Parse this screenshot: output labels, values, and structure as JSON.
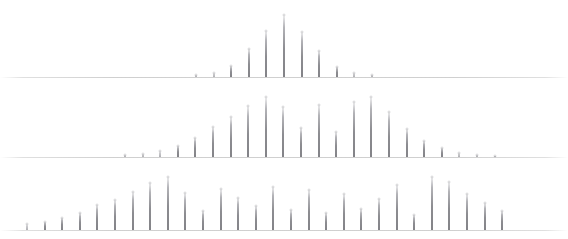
{
  "figure": {
    "title": "",
    "background_color": "#ffffff",
    "peak_color": "#78787d",
    "baseline_color": "#969696",
    "width": 568,
    "height": 239
  },
  "chart_data": {
    "type": "bar",
    "title": "",
    "subtitle": "",
    "xlabel": "",
    "ylabel": "",
    "grid": false,
    "legend_position": "none",
    "axis_ranges": {
      "x": [
        0,
        568
      ],
      "y": [
        0,
        1
      ]
    },
    "panels": [
      {
        "name": "panel-top",
        "index": 0,
        "baseline_y": 77,
        "max_peak_height": 62,
        "peak_spacing_px": 17.6,
        "first_peak_x": 196,
        "peak_count": 11,
        "x": [
          196,
          213.6,
          231.2,
          248.8,
          266.4,
          284,
          301.6,
          319.2,
          336.8,
          354.4,
          372
        ],
        "values": [
          0.035,
          0.07,
          0.17,
          0.45,
          0.74,
          1.0,
          0.73,
          0.42,
          0.16,
          0.07,
          0.03
        ],
        "tick_labels": [],
        "legend": []
      },
      {
        "name": "panel-middle",
        "index": 1,
        "baseline_y": 157,
        "max_peak_height": 62,
        "peak_spacing_px": 17.6,
        "first_peak_x": 125,
        "peak_count": 22,
        "x": [
          125,
          142.6,
          160.2,
          177.8,
          195.4,
          213,
          230.6,
          248.2,
          265.8,
          283.4,
          301,
          318.6,
          336.2,
          353.8,
          371.4,
          389,
          406.6,
          424.2,
          441.8,
          459.4,
          477,
          494.6
        ],
        "values": [
          0.03,
          0.05,
          0.1,
          0.17,
          0.3,
          0.48,
          0.64,
          0.82,
          0.96,
          0.8,
          0.46,
          0.84,
          0.4,
          0.88,
          0.97,
          0.72,
          0.45,
          0.26,
          0.14,
          0.07,
          0.04,
          0.02
        ],
        "tick_labels": [],
        "legend": []
      },
      {
        "name": "panel-bottom",
        "index": 2,
        "baseline_y": 230,
        "max_peak_height": 62,
        "peak_spacing_px": 17.6,
        "first_peak_x": 27,
        "peak_count": 28,
        "x": [
          27,
          44.6,
          62.2,
          79.8,
          97.4,
          115,
          132.6,
          150.2,
          167.8,
          185.4,
          203,
          220.6,
          238.2,
          255.8,
          273.4,
          291,
          308.6,
          326.2,
          343.8,
          361.4,
          379,
          396.6,
          414.2,
          431.8,
          449.4,
          467,
          484.6,
          502.2
        ],
        "values": [
          0.1,
          0.13,
          0.2,
          0.27,
          0.4,
          0.48,
          0.62,
          0.76,
          0.85,
          0.6,
          0.3,
          0.66,
          0.52,
          0.38,
          0.7,
          0.32,
          0.64,
          0.27,
          0.58,
          0.34,
          0.5,
          0.72,
          0.24,
          0.86,
          0.78,
          0.58,
          0.44,
          0.3
        ],
        "tick_labels": [],
        "legend": []
      }
    ]
  }
}
